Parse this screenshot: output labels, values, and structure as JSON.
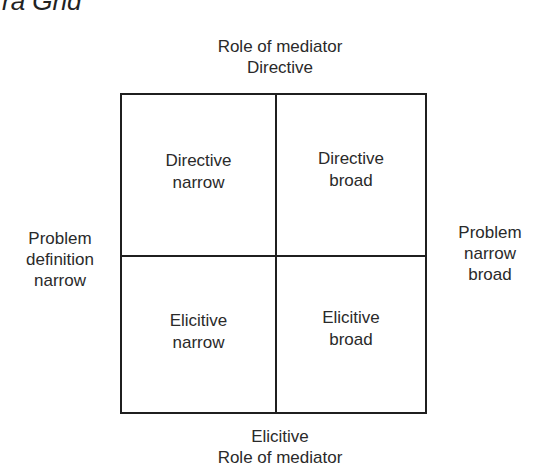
{
  "title_fragment": "ra Grid",
  "axes": {
    "top": {
      "line1": "Role of mediator",
      "line2": "Directive"
    },
    "bottom": {
      "line1": "Elicitive",
      "line2": "Role of mediator"
    },
    "left": {
      "line1": "Problem",
      "line2": "definition",
      "line3": "narrow"
    },
    "right": {
      "line1": "Problem",
      "line2": "narrow",
      "line3": "broad"
    }
  },
  "quadrants": {
    "top_left": {
      "line1": "Directive",
      "line2": "narrow"
    },
    "top_right": {
      "line1": "Directive",
      "line2": "broad"
    },
    "bottom_left": {
      "line1": "Elicitive",
      "line2": "narrow"
    },
    "bottom_right": {
      "line1": "Elicitive",
      "line2": "broad"
    }
  }
}
